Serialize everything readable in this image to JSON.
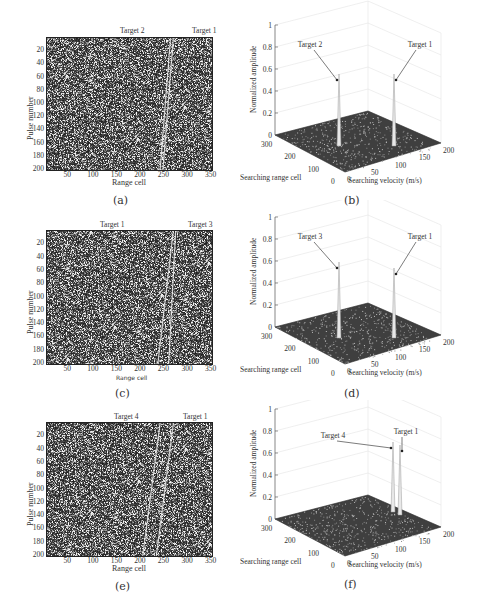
{
  "figure": {
    "panels": [
      {
        "id": "a",
        "caption": "(a)",
        "type": "range-pulse-image",
        "top_labels": [
          "Target 2",
          "Target 1"
        ],
        "ylabel": "Pulse number",
        "xlabel": "Range cell",
        "yticks": [
          "20",
          "40",
          "60",
          "80",
          "100",
          "120",
          "140",
          "160",
          "180",
          "200"
        ],
        "xticks": [
          "50",
          "100",
          "150",
          "200",
          "250",
          "300",
          "350"
        ],
        "tracks": [
          [
            262,
            0,
            240,
            200
          ],
          [
            268,
            0,
            246,
            200
          ]
        ]
      },
      {
        "id": "b",
        "caption": "(b)",
        "type": "3d-surface",
        "peak_labels": [
          "Target 2",
          "Target 1"
        ],
        "zlabel": "Normalized amplitude",
        "zticks": [
          "0",
          "0.2",
          "0.4",
          "0.6",
          "0.8",
          "1"
        ],
        "range_label": "Searching range cell",
        "range_ticks": [
          "300",
          "200",
          "100",
          "0"
        ],
        "vel_label": "Searching velocity (m/s)",
        "vel_ticks": [
          "0",
          "50",
          "100",
          "150",
          "200"
        ]
      },
      {
        "id": "c",
        "caption": "(c)",
        "type": "range-pulse-image",
        "top_labels": [
          "Target 1",
          "Target 3"
        ],
        "ylabel": "Pulse number",
        "xlabel": "Range cell",
        "yticks": [
          "20",
          "40",
          "60",
          "80",
          "100",
          "120",
          "140",
          "160",
          "180",
          "200"
        ],
        "xticks": [
          "50",
          "100",
          "150",
          "200",
          "250",
          "300",
          "350"
        ],
        "tracks": [
          [
            268,
            0,
            235,
            200
          ],
          [
            273,
            0,
            258,
            200
          ]
        ]
      },
      {
        "id": "d",
        "caption": "(d)",
        "type": "3d-surface",
        "peak_labels": [
          "Target 3",
          "Target 1"
        ],
        "zlabel": "Normalized amplitude",
        "zticks": [
          "0",
          "0.2",
          "0.4",
          "0.6",
          "0.8",
          "1"
        ],
        "range_label": "Searching range cell",
        "range_ticks": [
          "300",
          "200",
          "100",
          "0"
        ],
        "vel_label": "Searching velocity (m/s)",
        "vel_ticks": [
          "0",
          "50",
          "100",
          "150",
          "200"
        ]
      },
      {
        "id": "e",
        "caption": "(e)",
        "type": "range-pulse-image",
        "top_labels": [
          "Target 4",
          "Target 1"
        ],
        "ylabel": "Pulse number",
        "xlabel": "Range cell",
        "yticks": [
          "20",
          "40",
          "60",
          "80",
          "100",
          "120",
          "140",
          "160",
          "180",
          "200"
        ],
        "xticks": [
          "50",
          "100",
          "150",
          "200",
          "250",
          "300",
          "350"
        ],
        "tracks": [
          [
            240,
            0,
            203,
            200
          ],
          [
            268,
            0,
            232,
            200
          ]
        ]
      },
      {
        "id": "f",
        "caption": "(f)",
        "type": "3d-surface",
        "peak_labels": [
          "Target 4",
          "Target 1"
        ],
        "zlabel": "Normalized amplitude",
        "zticks": [
          "0",
          "0.2",
          "0.4",
          "0.6",
          "0.8",
          "1"
        ],
        "range_label": "Searching range cell",
        "range_ticks": [
          "300",
          "200",
          "100",
          "0"
        ],
        "vel_label": "Searching velocity (m/s)",
        "vel_ticks": [
          "0",
          "50",
          "100",
          "150",
          "200"
        ]
      }
    ]
  },
  "chart_data": [
    {
      "type": "heatmap",
      "panel": "a",
      "xlabel": "Range cell",
      "ylabel": "Pulse number",
      "xlim": [
        0,
        350
      ],
      "ylim": [
        200,
        0
      ],
      "annotations": [
        "Target 2",
        "Target 1"
      ],
      "description": "Two near-parallel bright straight tracks between range cells ~240-268 over noise"
    },
    {
      "type": "surface",
      "panel": "b",
      "xlabel": "Searching velocity (m/s)",
      "ylabel": "Searching range cell",
      "zlabel": "Normalized amplitude",
      "zlim": [
        0,
        1
      ],
      "peaks": [
        {
          "label": "Target 2",
          "amplitude": 0.85
        },
        {
          "label": "Target 1",
          "amplitude": 0.85
        }
      ]
    },
    {
      "type": "heatmap",
      "panel": "c",
      "xlabel": "Range cell",
      "ylabel": "Pulse number",
      "xlim": [
        0,
        350
      ],
      "ylim": [
        200,
        0
      ],
      "annotations": [
        "Target 1",
        "Target 3"
      ],
      "description": "Two bright tracks crossing range cells ~235-273"
    },
    {
      "type": "surface",
      "panel": "d",
      "xlabel": "Searching velocity (m/s)",
      "ylabel": "Searching range cell",
      "zlabel": "Normalized amplitude",
      "zlim": [
        0,
        1
      ],
      "peaks": [
        {
          "label": "Target 3",
          "amplitude": 0.88
        },
        {
          "label": "Target 1",
          "amplitude": 0.8
        }
      ]
    },
    {
      "type": "heatmap",
      "panel": "e",
      "xlabel": "Range cell",
      "ylabel": "Pulse number",
      "xlim": [
        0,
        350
      ],
      "ylim": [
        200,
        0
      ],
      "annotations": [
        "Target 4",
        "Target 1"
      ],
      "description": "Two parallel bright tracks, ~203-240 and ~232-268"
    },
    {
      "type": "surface",
      "panel": "f",
      "xlabel": "Searching velocity (m/s)",
      "ylabel": "Searching range cell",
      "zlabel": "Normalized amplitude",
      "zlim": [
        0,
        1
      ],
      "peaks": [
        {
          "label": "Target 4",
          "amplitude": 0.85
        },
        {
          "label": "Target 1",
          "amplitude": 0.85
        }
      ]
    }
  ]
}
